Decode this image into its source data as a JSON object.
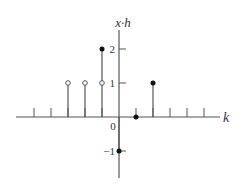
{
  "chart_data": {
    "type": "stem",
    "title": "",
    "xlabel": "k",
    "ylabel": "x·h",
    "origin_label": "0",
    "y_ticks": [
      {
        "value": 2,
        "label": "2"
      },
      {
        "value": 1,
        "label": "1"
      },
      {
        "value": -1,
        "label": "−1"
      }
    ],
    "x_ticks": [
      -5,
      -4,
      -3,
      -2,
      -1,
      1,
      2,
      3,
      4,
      5
    ],
    "xlim": [
      -6,
      6
    ],
    "ylim": [
      -1.8,
      2.6
    ],
    "points": [
      {
        "k": -3,
        "value": 1,
        "marker": "open"
      },
      {
        "k": -2,
        "value": 1,
        "marker": "open"
      },
      {
        "k": -1,
        "value": 1,
        "marker": "open"
      },
      {
        "k": -1,
        "value": 2,
        "marker": "filled"
      },
      {
        "k": 0,
        "value": -1,
        "marker": "filled"
      },
      {
        "k": 1,
        "value": 0,
        "marker": "filled"
      },
      {
        "k": 2,
        "value": 1,
        "marker": "filled"
      }
    ],
    "colors": {
      "line": "#555555",
      "marker": "#111111",
      "text": "#333333"
    }
  }
}
